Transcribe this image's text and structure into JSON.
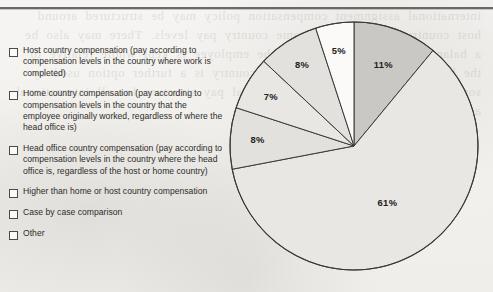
{
  "page": {
    "background_color": "#f4f3f1",
    "rule_color": "#4a4a48",
    "bleed_text": "international assignment compensation policy may be structured around host country pay levels or home country pay levels. There may also be a balance sheet approach where the employee is kept whole relative to the home country. The head office country is a further option used by some organizations with a single global pay structure for all international assignees and expatriate staff."
  },
  "legend": {
    "items": [
      {
        "id": "host-country-compensation",
        "marker": "checkbox-empty",
        "label": "Host country compensation (pay according to compensation levels in the country where work is completed)"
      },
      {
        "id": "home-country-compensation",
        "marker": "checkbox-empty",
        "label": "Home country compensation (pay according to compensation levels in the country that the employee originally worked, regardless of where the head office is)"
      },
      {
        "id": "head-office-country-compensation",
        "marker": "checkbox-empty",
        "label": "Head office country compensation (pay according to compensation levels in the country where the head office is, regardless of the host or home country)"
      },
      {
        "id": "higher-than-home-or-host",
        "marker": "checkbox-empty",
        "label": "Higher than home or host country compensation"
      },
      {
        "id": "case-by-case-comparison",
        "marker": "checkbox-empty",
        "label": "Case by case comparison"
      },
      {
        "id": "other",
        "marker": "checkbox-empty",
        "label": "Other"
      }
    ]
  },
  "chart_data": {
    "type": "pie",
    "title": "",
    "subtitle": "",
    "xlabel": "",
    "ylabel": "",
    "grid": false,
    "legend_position": "left",
    "start_angle_deg": 0,
    "direction": "clockwise",
    "units": "percent",
    "total": 100,
    "outline_color": "#3c3a37",
    "categories": [
      "Host country compensation (pay according to compensation levels in the country where work is completed)",
      "Home country compensation (pay according to compensation levels in the country that the employee originally worked, regardless of where the head office is)",
      "Head office country compensation (pay according to compensation levels in the country where the head office is, regardless of the host or home country)",
      "Higher than home or host country compensation",
      "Case by case comparison",
      "Other"
    ],
    "values": [
      11,
      61,
      8,
      7,
      8,
      5
    ],
    "labels": [
      "11%",
      "61%",
      "8%",
      "7%",
      "8%",
      "5%"
    ],
    "colors": [
      "#c9c8c4",
      "#e8e7e3",
      "#e2e1dd",
      "#e8e7e3",
      "#e2e1dd",
      "#fbfaf8"
    ],
    "slices": [
      {
        "name": "host-country-compensation",
        "value": 11,
        "label": "11%",
        "color": "#c9c8c4"
      },
      {
        "name": "home-country-compensation",
        "value": 61,
        "label": "61%",
        "color": "#e8e7e3"
      },
      {
        "name": "head-office-country-compensation",
        "value": 8,
        "label": "8%",
        "color": "#e2e1dd"
      },
      {
        "name": "higher-than-home-or-host",
        "value": 7,
        "label": "7%",
        "color": "#e8e7e3"
      },
      {
        "name": "case-by-case-comparison",
        "value": 8,
        "label": "8%",
        "color": "#e2e1dd"
      },
      {
        "name": "other",
        "value": 5,
        "label": "5%",
        "color": "#fbfaf8"
      }
    ]
  }
}
